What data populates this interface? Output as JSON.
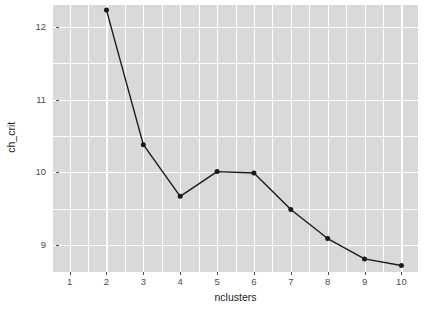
{
  "chart_data": {
    "type": "line",
    "title": "",
    "subtitle": "",
    "xlabel": "nclusters",
    "ylabel": "ch_crit",
    "x": [
      2,
      3,
      4,
      5,
      6,
      7,
      8,
      9,
      10
    ],
    "values": [
      12.23,
      10.38,
      9.67,
      10.01,
      9.99,
      9.49,
      9.09,
      8.81,
      8.72
    ],
    "series": [
      {
        "name": "ch_crit",
        "x": [
          2,
          3,
          4,
          5,
          6,
          7,
          8,
          9,
          10
        ],
        "values": [
          12.23,
          10.38,
          9.67,
          10.01,
          9.99,
          9.49,
          9.09,
          8.81,
          8.72
        ]
      }
    ],
    "xlim": [
      0.55,
      10.45
    ],
    "ylim": [
      8.63,
      12.3
    ],
    "x_tick_labels": [
      "1",
      "2",
      "3",
      "4",
      "5",
      "6",
      "7",
      "8",
      "9",
      "10"
    ],
    "x_tick_values": [
      1,
      2,
      3,
      4,
      5,
      6,
      7,
      8,
      9,
      10
    ],
    "y_tick_labels": [
      "9",
      "10",
      "11",
      "12"
    ],
    "y_tick_values": [
      9,
      10,
      11,
      12
    ],
    "y_minor_values": [
      8.5,
      9.5,
      10.5,
      11.5,
      12.5
    ],
    "x_minor_values": [
      1.5,
      2.5,
      3.5,
      4.5,
      5.5,
      6.5,
      7.5,
      8.5,
      9.5
    ],
    "grid": true,
    "legend": "none",
    "marker": "circle",
    "colors": {
      "panel_background": "#d9d9d9",
      "gridline": "#ffffff",
      "line": "#1a1a1a",
      "point": "#1a1a1a",
      "axis_text": "#4d4d4d",
      "axis_title": "#1a1a1a",
      "plot_background": "#ffffff"
    }
  }
}
